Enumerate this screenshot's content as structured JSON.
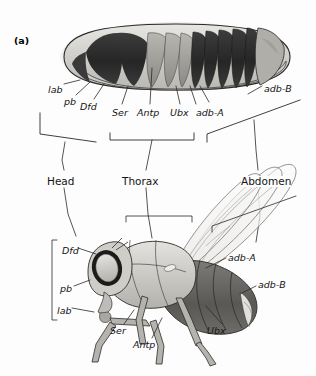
{
  "figure": {
    "panel_label": "(a)",
    "embryo": {
      "genes": [
        {
          "id": "lab",
          "label": "lab",
          "x": 48,
          "y": 85
        },
        {
          "id": "pb",
          "label": "pb",
          "x": 64,
          "y": 97
        },
        {
          "id": "Dfd",
          "label": "Dfd",
          "x": 80,
          "y": 102
        },
        {
          "id": "Ser",
          "label": "Ser",
          "x": 112,
          "y": 108
        },
        {
          "id": "Antp",
          "label": "Antp",
          "x": 137,
          "y": 108
        },
        {
          "id": "Ubx",
          "label": "Ubx",
          "x": 170,
          "y": 108
        },
        {
          "id": "adb-A",
          "label": "adb-A",
          "x": 196,
          "y": 108
        },
        {
          "id": "adb-B",
          "label": "adb-B",
          "x": 264,
          "y": 84
        }
      ]
    },
    "regions": [
      {
        "id": "head",
        "label": "Head",
        "x": 47,
        "y": 176
      },
      {
        "id": "thorax",
        "label": "Thorax",
        "x": 122,
        "y": 176
      },
      {
        "id": "abdomen",
        "label": "Abdomen",
        "x": 241,
        "y": 176
      }
    ],
    "adult": {
      "genes": [
        {
          "id": "Dfd",
          "label": "Dfd",
          "x": 62,
          "y": 246
        },
        {
          "id": "pb",
          "label": "pb",
          "x": 60,
          "y": 284
        },
        {
          "id": "lab",
          "label": "lab",
          "x": 57,
          "y": 306
        },
        {
          "id": "Ser",
          "label": "Ser",
          "x": 110,
          "y": 326
        },
        {
          "id": "Antp",
          "label": "Antp",
          "x": 133,
          "y": 340
        },
        {
          "id": "Ubx",
          "label": "Ubx",
          "x": 207,
          "y": 326
        },
        {
          "id": "adb-A",
          "label": "adb-A",
          "x": 228,
          "y": 253
        },
        {
          "id": "adb-B",
          "label": "adb-B",
          "x": 258,
          "y": 280
        }
      ]
    },
    "colors": {
      "line": "#1b1b1b",
      "leader": "#2a2a2a",
      "embryo_dark": "#2c2c2c",
      "embryo_mid": "#8e8e8e",
      "embryo_light": "#d6d4d0",
      "body_light": "#d9d7d2",
      "body_mid": "#a7a5a0",
      "body_dark": "#5d5b58",
      "wing": "#f2f1ef",
      "eye": "#f5f4f2"
    }
  }
}
